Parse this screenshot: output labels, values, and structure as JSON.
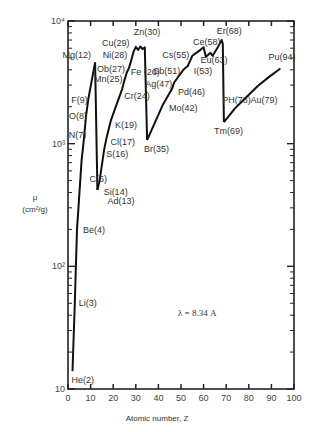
{
  "chart_data": {
    "type": "line",
    "title": "",
    "xlabel": "Atomic number, Z",
    "ylabel": "μ (cm²/g)",
    "ylabel_parts": {
      "mu": "μ",
      "units": "(cm²/g)"
    },
    "yscale": "log",
    "xlim": [
      0,
      100
    ],
    "ylim": [
      10,
      10000
    ],
    "x_ticks": [
      0,
      10,
      20,
      30,
      40,
      50,
      60,
      70,
      80,
      90,
      100
    ],
    "y_ticks": [
      "10",
      "10²",
      "10³",
      "10⁴"
    ],
    "annotation": "λ = 8.34 A",
    "grid": false,
    "series": [
      {
        "name": "Mass absorption coefficient",
        "segments": [
          {
            "x": [
              2,
              3,
              4,
              6,
              7,
              8,
              9,
              12
            ],
            "y": [
              14,
              50,
              200,
              730,
              1070,
              1700,
              2300,
              4600
            ]
          },
          {
            "x": [
              12,
              13
            ],
            "y": [
              4600,
              420
            ]
          },
          {
            "x": [
              13,
              14,
              16,
              17,
              19,
              24,
              25,
              26,
              27,
              28,
              29,
              30,
              31,
              32,
              33,
              34,
              35
            ],
            "y": [
              420,
              500,
              900,
              1100,
              1550,
              2800,
              3300,
              3800,
              4150,
              4800,
              5600,
              6150,
              5800,
              6200,
              5900,
              6100,
              1070
            ]
          },
          {
            "x": [
              35,
              42,
              46,
              47,
              51,
              53,
              55,
              58,
              60,
              61,
              63,
              64,
              66,
              68,
              68.5,
              69
            ],
            "y": [
              1070,
              2080,
              2800,
              3150,
              4000,
              4300,
              5200,
              5700,
              6100,
              5100,
              5500,
              5200,
              6000,
              7000,
              6500,
              1500
            ]
          },
          {
            "x": [
              69,
              74,
              78,
              79,
              84,
              89,
              94
            ],
            "y": [
              1500,
              1950,
              2300,
              2400,
              2950,
              3500,
              4100
            ]
          }
        ]
      }
    ],
    "point_labels": [
      {
        "text": "He(2)",
        "x": 2,
        "y": 14
      },
      {
        "text": "Li(3)",
        "x": 3,
        "y": 50
      },
      {
        "text": "Be(4)",
        "x": 4,
        "y": 200
      },
      {
        "text": "C(6)",
        "x": 6,
        "y": 730
      },
      {
        "text": "N(7)",
        "x": 7,
        "y": 1070
      },
      {
        "text": "O(8)",
        "x": 8,
        "y": 1700
      },
      {
        "text": "F(9)",
        "x": 9,
        "y": 2300
      },
      {
        "text": "Mg(12)",
        "x": 12,
        "y": 4600
      },
      {
        "text": "Ad(13)",
        "x": 13,
        "y": 420
      },
      {
        "text": "Si(14)",
        "x": 14,
        "y": 500
      },
      {
        "text": "S(16)",
        "x": 16,
        "y": 900
      },
      {
        "text": "Cl(17)",
        "x": 17,
        "y": 1100
      },
      {
        "text": "K(19)",
        "x": 19,
        "y": 1550
      },
      {
        "text": "Cr(24)",
        "x": 24,
        "y": 2800
      },
      {
        "text": "Mn(25)",
        "x": 25,
        "y": 3300
      },
      {
        "text": "Fe (26)",
        "x": 26,
        "y": 3800
      },
      {
        "text": "Ob(27)",
        "x": 27,
        "y": 4150
      },
      {
        "text": "Ni(28)",
        "x": 28,
        "y": 4800
      },
      {
        "text": "Cu(29)",
        "x": 29,
        "y": 5600
      },
      {
        "text": "Zn(30)",
        "x": 30,
        "y": 6150
      },
      {
        "text": "Br(35)",
        "x": 35,
        "y": 1070
      },
      {
        "text": "Mo(42)",
        "x": 42,
        "y": 2080
      },
      {
        "text": "Pd(46)",
        "x": 46,
        "y": 2800
      },
      {
        "text": "Ag(47)",
        "x": 47,
        "y": 3150
      },
      {
        "text": "Sb(51)",
        "x": 51,
        "y": 4000
      },
      {
        "text": "I(53)",
        "x": 53,
        "y": 4300
      },
      {
        "text": "Cs(55)",
        "x": 55,
        "y": 5200
      },
      {
        "text": "Ce(58)",
        "x": 58,
        "y": 5700
      },
      {
        "text": "Eu(63)",
        "x": 63,
        "y": 5500
      },
      {
        "text": "Er(68)",
        "x": 68,
        "y": 7000
      },
      {
        "text": "Tm(69)",
        "x": 69,
        "y": 1500
      },
      {
        "text": "PH(78)",
        "x": 78,
        "y": 2300
      },
      {
        "text": "Au(79)",
        "x": 79,
        "y": 2400
      },
      {
        "text": "Pu(94)",
        "x": 94,
        "y": 4100
      }
    ]
  }
}
